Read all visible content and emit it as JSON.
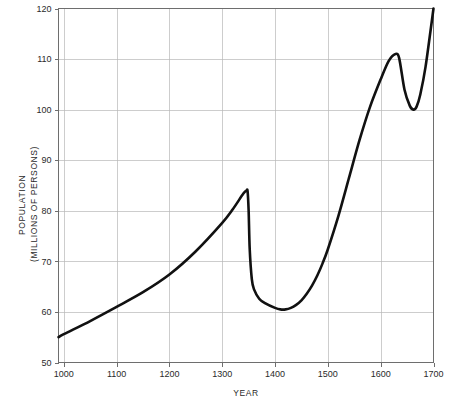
{
  "chart_data": {
    "type": "line",
    "title": "",
    "subtitle": "",
    "xlabel": "YEAR",
    "ylabel": "POPULATION (MILLIONS OF PERSONS)",
    "ylabel_lines": [
      "POPULATION",
      "(MILLIONS OF PERSONS)"
    ],
    "xlim": [
      990,
      1700
    ],
    "ylim": [
      50,
      120
    ],
    "xticks": [
      1000,
      1100,
      1200,
      1300,
      1400,
      1500,
      1600,
      1700
    ],
    "xtick_labels": [
      "1000",
      "1100",
      "1200",
      "1300",
      "1400",
      "1500",
      "1600",
      "1700"
    ],
    "yticks": [
      50,
      60,
      70,
      80,
      90,
      100,
      110,
      120
    ],
    "ytick_labels": [
      "50",
      "60",
      "70",
      "80",
      "90",
      "100",
      "110",
      "120"
    ],
    "grid": true,
    "legend": "none",
    "line_color": "#111111",
    "grid_color": "#b8b8b8",
    "frame_color": "#6e6e6e",
    "series": [
      {
        "name": "Population",
        "x": [
          990,
          1000,
          1050,
          1100,
          1150,
          1200,
          1250,
          1300,
          1320,
          1340,
          1346,
          1348,
          1350,
          1352,
          1356,
          1360,
          1370,
          1380,
          1400,
          1410,
          1420,
          1430,
          1440,
          1450,
          1460,
          1470,
          1480,
          1490,
          1500,
          1520,
          1540,
          1560,
          1580,
          1600,
          1615,
          1628,
          1635,
          1645,
          1655,
          1662,
          1668,
          1675,
          1685,
          1700
        ],
        "values": [
          55.0,
          55.6,
          58.2,
          61.0,
          63.9,
          67.4,
          72.0,
          77.6,
          80.3,
          83.4,
          84.0,
          83.9,
          80.0,
          72.5,
          66.5,
          64.5,
          62.6,
          61.8,
          60.8,
          60.5,
          60.5,
          60.8,
          61.4,
          62.3,
          63.6,
          65.2,
          67.2,
          69.6,
          72.4,
          79.0,
          86.5,
          94.0,
          100.6,
          106.0,
          109.6,
          111.0,
          110.2,
          104.0,
          100.8,
          100.0,
          100.6,
          103.0,
          108.5,
          120.0
        ]
      }
    ],
    "annotations": [
      {
        "label": "pre-plague peak",
        "x": 1347,
        "y": 84.0
      },
      {
        "label": "plague collapse",
        "x": 1350,
        "y": 80.0
      },
      {
        "label": "post-plague minimum",
        "x": 1413,
        "y": 60.5
      },
      {
        "label": "local maximum",
        "x": 1628,
        "y": 111.0
      },
      {
        "label": "local minimum",
        "x": 1662,
        "y": 100.0
      },
      {
        "label": "end value",
        "x": 1700,
        "y": 120.0
      }
    ]
  }
}
